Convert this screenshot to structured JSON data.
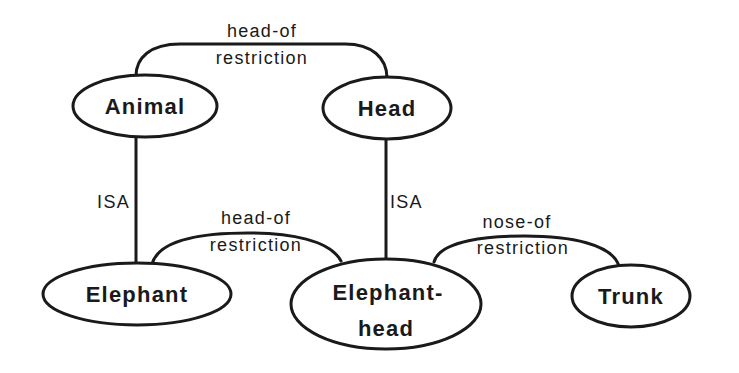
{
  "diagram": {
    "type": "semantic-network",
    "nodes": [
      {
        "id": "animal",
        "label": "Animal"
      },
      {
        "id": "head",
        "label": "Head"
      },
      {
        "id": "elephant",
        "label": "Elephant"
      },
      {
        "id": "elephant_head",
        "label_line1": "Elephant-",
        "label_line2": "head"
      },
      {
        "id": "trunk",
        "label": "Trunk"
      }
    ],
    "edges": [
      {
        "id": "animal_head",
        "from": "Animal",
        "to": "Head",
        "label_line1": "head-of",
        "label_line2": "restriction"
      },
      {
        "id": "elephant_isa_animal",
        "from": "Elephant",
        "to": "Animal",
        "label": "ISA"
      },
      {
        "id": "elephanthead_isa_head",
        "from": "Elephant-head",
        "to": "Head",
        "label": "ISA"
      },
      {
        "id": "elephant_elephanthead",
        "from": "Elephant",
        "to": "Elephant-head",
        "label_line1": "head-of",
        "label_line2": "restriction"
      },
      {
        "id": "elephanthead_trunk",
        "from": "Elephant-head",
        "to": "Trunk",
        "label_line1": "nose-of",
        "label_line2": "restriction"
      }
    ],
    "colors": {
      "stroke": "#1a1a1a",
      "background": "#ffffff"
    }
  }
}
